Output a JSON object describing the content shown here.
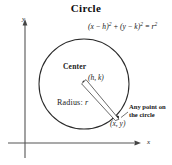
{
  "figure": {
    "title": "Circle",
    "background_color": "#ffffff",
    "ink_color": "#1a1a1a"
  },
  "equation": {
    "full": "(x − h)² + (y − k)² = r²",
    "lhs_term1_open": "(",
    "lhs_term1_var": "x",
    "lhs_term1_minus": " − ",
    "lhs_term1_param": "h",
    "lhs_term1_close": ")",
    "exp_2_a": "2",
    "plus": " + ",
    "lhs_term2_open": "(",
    "lhs_term2_var": "y",
    "lhs_term2_minus": " − ",
    "lhs_term2_param": "k",
    "lhs_term2_close": ")",
    "exp_2_b": "2",
    "equals": " = ",
    "rhs_var": "r",
    "exp_2_c": "2"
  },
  "axes": {
    "y_label": "y",
    "x_label": "x",
    "y_axis_x": 25,
    "y_axis_top": 22,
    "y_axis_bottom": 158,
    "x_axis_y": 143,
    "x_axis_left": 8,
    "x_axis_right": 140
  },
  "circle": {
    "center_x": 84,
    "center_y": 84,
    "radius": 45,
    "stroke_color": "#2a2a2a"
  },
  "labels": {
    "center": "Center",
    "center_coords": "(h, k)",
    "radius": "Radius: ",
    "radius_value": "r",
    "point_coords": "(x, y)",
    "any_point_note": "Any point on the circle"
  },
  "markers": {
    "center_dot_x": 84,
    "center_dot_y": 82,
    "point_on_circle_x": 119,
    "point_on_circle_y": 119
  }
}
